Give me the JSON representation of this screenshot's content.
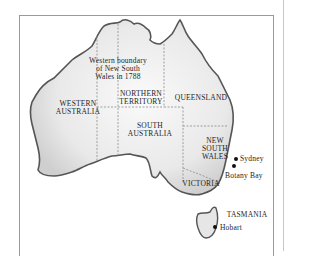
{
  "map": {
    "title": "Australia — states and territories",
    "annotation": [
      "Western boundary",
      "of New South",
      "Wales in 1788"
    ],
    "regions": {
      "western_australia": [
        "WESTERN",
        "AUSTRALIA"
      ],
      "northern_territory": [
        "NORTHERN",
        "TERRITORY"
      ],
      "queensland": [
        "QUEENSLAND"
      ],
      "south_australia": [
        "SOUTH",
        "AUSTRALIA"
      ],
      "new_south_wales": [
        "NEW",
        "SOUTH",
        "WALES"
      ],
      "victoria": [
        "VICTORIA"
      ],
      "tasmania": [
        "TASMANIA"
      ]
    },
    "cities": {
      "sydney": "Sydney",
      "botany_bay": "Botany Bay",
      "hobart": "Hobart"
    },
    "colors": {
      "land": "#ececec",
      "coast": "#555555",
      "border_dash": "#8a8a8a",
      "text": "#1e1e1e"
    }
  }
}
